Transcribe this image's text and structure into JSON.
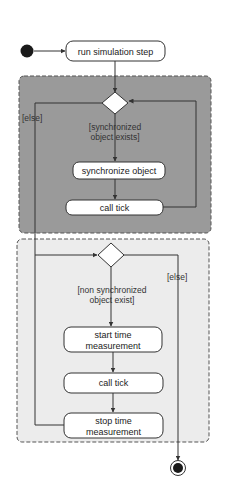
{
  "diagram": {
    "type": "UML activity diagram",
    "colors": {
      "background": "#ffffff",
      "group_dark_fill": "#9a9a9a",
      "group_light_fill": "#ececec",
      "group_border": "#555555",
      "node_fill": "#ffffff",
      "line": "#333333",
      "initial_node": "#1a1a1a"
    },
    "nodes": {
      "start": {
        "kind": "initial-node"
      },
      "run_step": {
        "label": "run simulation step"
      },
      "decision_sync": {
        "kind": "decision"
      },
      "sync_object": {
        "label": "synchronize object"
      },
      "call_tick_1": {
        "label": "call tick"
      },
      "decision_nonsync": {
        "kind": "decision"
      },
      "start_time": {
        "label_line1": "start time",
        "label_line2": "measurement"
      },
      "call_tick_2": {
        "label": "call tick"
      },
      "stop_time": {
        "label_line1": "stop time",
        "label_line2": "measurement"
      },
      "end": {
        "kind": "final-node"
      }
    },
    "guards": {
      "sync_exists_line1": "[synchronized",
      "sync_exists_line2": "object exists]",
      "else_left": "[else]",
      "nonsync_exists_line1": "[non synchronized",
      "nonsync_exists_line2": "object exist]",
      "else_right": "[else]"
    },
    "groups": [
      {
        "name": "synchronized-objects-loop",
        "style": "dark"
      },
      {
        "name": "non-synchronized-objects-loop",
        "style": "light"
      }
    ]
  }
}
